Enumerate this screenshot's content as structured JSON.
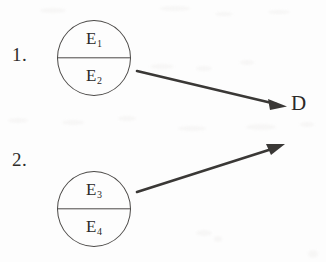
{
  "diagram": {
    "background_color": "#fdfdfd",
    "ink_color": "#3a3836",
    "items": [
      {
        "number": "1.",
        "node": {
          "shape": "divided-circle",
          "top_label": "E",
          "top_subscript": "1",
          "bottom_label": "E",
          "bottom_subscript": "2"
        },
        "arrow": {
          "name": "arrow-1",
          "direction": "down-right",
          "from": [
            137,
            71
          ],
          "to": [
            286,
            106
          ]
        }
      },
      {
        "number": "2.",
        "node": {
          "shape": "divided-circle",
          "top_label": "E",
          "top_subscript": "3",
          "bottom_label": "E",
          "bottom_subscript": "4"
        },
        "arrow": {
          "name": "arrow-2",
          "direction": "up-right",
          "from": [
            137,
            192
          ],
          "to": [
            284,
            144
          ]
        }
      }
    ],
    "target": {
      "label": "D"
    }
  }
}
